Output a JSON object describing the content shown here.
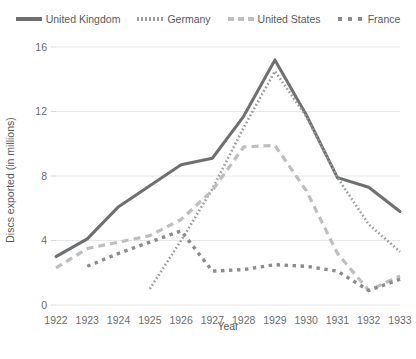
{
  "legend": {
    "position": "top-center",
    "items": [
      {
        "label": "United Kingdom",
        "style": "solid",
        "color": "#6e6f71",
        "swatch": "legend-swatch-uk"
      },
      {
        "label": "Germany",
        "style": "fine-dotted",
        "color": "#9a9b9d",
        "swatch": "legend-swatch-germany"
      },
      {
        "label": "United States",
        "style": "dashed",
        "color": "#bdbec0",
        "swatch": "legend-swatch-united-states"
      },
      {
        "label": "France",
        "style": "square-dotted",
        "color": "#8a8b8d",
        "swatch": "legend-swatch-france"
      }
    ]
  },
  "axes": {
    "xlabel": "Year",
    "ylabel": "Discs exported (in millions)",
    "yticks": [
      "0",
      "4",
      "8",
      "12",
      "16"
    ],
    "xticks": [
      "1922",
      "1923",
      "1924",
      "1925",
      "1926",
      "1927",
      "1928",
      "1929",
      "1930",
      "1931",
      "1932",
      "1933"
    ]
  },
  "chart_data": {
    "type": "line",
    "title": "",
    "xlabel": "Year",
    "ylabel": "Discs exported (in millions)",
    "categories": [
      "1922",
      "1923",
      "1924",
      "1925",
      "1926",
      "1927",
      "1928",
      "1929",
      "1930",
      "1931",
      "1932",
      "1933"
    ],
    "x": [
      1922,
      1923,
      1924,
      1925,
      1926,
      1927,
      1928,
      1929,
      1930,
      1931,
      1932,
      1933
    ],
    "ylim": [
      0,
      16
    ],
    "xlim": [
      1922,
      1933
    ],
    "grid": "horizontal",
    "legend_position": "top-center",
    "series": [
      {
        "name": "United Kingdom",
        "color": "#6e6f71",
        "style": "solid",
        "values": [
          3.0,
          4.1,
          6.1,
          7.4,
          8.7,
          9.1,
          11.7,
          15.2,
          11.8,
          7.9,
          7.3,
          5.8
        ]
      },
      {
        "name": "Germany",
        "color": "#9a9b9d",
        "style": "fine-dotted",
        "values": [
          null,
          null,
          null,
          1.0,
          4.0,
          7.2,
          11.0,
          14.5,
          11.7,
          7.9,
          5.0,
          3.3
        ]
      },
      {
        "name": "United States",
        "color": "#bdbec0",
        "style": "dashed",
        "values": [
          2.3,
          3.5,
          3.9,
          4.3,
          5.3,
          7.1,
          9.8,
          9.9,
          7.1,
          3.2,
          0.9,
          1.8
        ]
      },
      {
        "name": "France",
        "color": "#8a8b8d",
        "style": "square-dotted",
        "values": [
          null,
          2.4,
          3.2,
          3.9,
          4.6,
          2.1,
          2.2,
          2.5,
          2.4,
          2.1,
          0.9,
          1.6
        ]
      }
    ]
  }
}
